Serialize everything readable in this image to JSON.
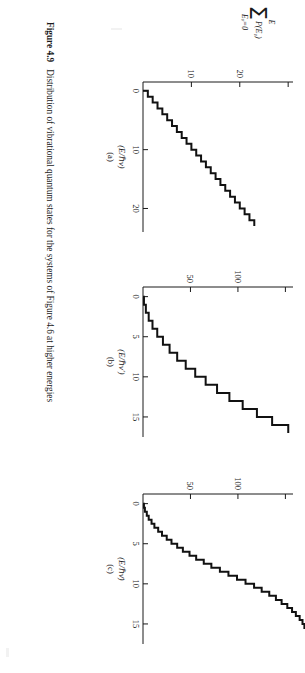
{
  "figure": {
    "number": "Figure 4.9",
    "caption": "Distribution of vibrational quantum states for the systems of Figure 4.6 at higher energies",
    "y_axis_label": {
      "upper_limit": "E",
      "symbol": "Σ",
      "argument": "P(E",
      "argument_sub": "v",
      "argument_close": ")",
      "lower_limit": "E",
      "lower_limit_sub": "v",
      "lower_limit_value": "=0"
    }
  },
  "panels": [
    {
      "letter": "(a)",
      "xlabel_open": "(E/",
      "xlabel_hbar": "ℏ",
      "xlabel_nu": "ν",
      "xlabel_close": ")",
      "xticks": [
        0,
        10,
        20
      ],
      "xlim": [
        -1.5,
        24
      ],
      "yticks": [
        10,
        20
      ],
      "ytick_unlabeled": [
        30
      ],
      "ylim": [
        0,
        31
      ]
    },
    {
      "letter": "(b)",
      "xlabel_open": "(E/",
      "xlabel_hbar": "ℏ",
      "xlabel_nu": "ν′",
      "xlabel_close": ")",
      "xticks": [
        0,
        5,
        10,
        15
      ],
      "xlim": [
        -1.2,
        17.5
      ],
      "yticks": [
        50,
        100
      ],
      "ytick_unlabeled": [
        150
      ],
      "ylim": [
        0,
        158
      ]
    },
    {
      "letter": "(c)",
      "xlabel_open": "(E/",
      "xlabel_hbar": "ℏ",
      "xlabel_nu": "ν̄",
      "xlabel_close": ")",
      "xticks": [
        0,
        5,
        10,
        15
      ],
      "xlim": [
        -1.2,
        17.5
      ],
      "yticks": [
        50,
        100
      ],
      "ytick_unlabeled": [
        150
      ],
      "ylim": [
        0,
        158
      ]
    }
  ],
  "chart_data": [
    {
      "type": "line",
      "panel": "(a)",
      "title": "",
      "xlabel": "(E/ℏν)",
      "ylabel": "Σ P(E_v), E_v=0 to E",
      "xlim": [
        -1.5,
        24
      ],
      "ylim": [
        0,
        31
      ],
      "grid": false,
      "legend": "none",
      "drawstyle": "steps-post",
      "note": "Cumulative number of vibrational quantum states vs reduced energy; rises as a simple staircase with one new state per unit of E/hv.",
      "x": [
        0,
        1,
        2,
        3,
        4,
        5,
        6,
        7,
        8,
        9,
        10,
        11,
        12,
        13,
        14,
        15,
        16,
        17,
        18,
        19,
        20,
        21,
        22
      ],
      "y": [
        1,
        2,
        3,
        4,
        5,
        6,
        7,
        8,
        9,
        10,
        11,
        12,
        13,
        14,
        15,
        16,
        17,
        18,
        19,
        20,
        21,
        22,
        23
      ]
    },
    {
      "type": "line",
      "panel": "(b)",
      "title": "",
      "xlabel": "(E/ℏν′)",
      "ylabel": "Σ P(E_v), E_v=0 to E",
      "xlim": [
        -1.2,
        17.5
      ],
      "ylim": [
        0,
        158
      ],
      "grid": false,
      "legend": "none",
      "drawstyle": "steps-post",
      "note": "Cumulative state count for a two-oscillator system; staircase with increasing tread heights, approaching ~135 at E/hv' = 16.",
      "x": [
        0,
        1,
        2,
        3,
        4,
        5,
        6,
        7,
        8,
        9,
        10,
        11,
        12,
        13,
        14,
        15,
        16
      ],
      "y": [
        1,
        3,
        6,
        10,
        15,
        21,
        28,
        36,
        45,
        55,
        66,
        78,
        91,
        105,
        120,
        136,
        153
      ]
    },
    {
      "type": "line",
      "panel": "(c)",
      "title": "",
      "xlabel": "(E/ℏν̄)",
      "ylabel": "Σ P(E_v), E_v=0 to E",
      "xlim": [
        -1.2,
        17.5
      ],
      "ylim": [
        0,
        158
      ],
      "grid": false,
      "legend": "none",
      "drawstyle": "steps-post",
      "note": "Cumulative state count for the degenerate-frequency system; finer staircase with many small steps at low energy, smoothing toward a curve.",
      "x": [
        0,
        0.5,
        1,
        1.5,
        2,
        2.5,
        3,
        3.5,
        4,
        4.5,
        5,
        5.5,
        6,
        6.5,
        7,
        7.5,
        8,
        8.5,
        9,
        9.5,
        10,
        10.5,
        11,
        11.5,
        12,
        12.5,
        13,
        13.5,
        14,
        14.5,
        15,
        15.5,
        16,
        16.5
      ],
      "y": [
        1,
        2,
        4,
        6,
        9,
        12,
        16,
        20,
        25,
        30,
        36,
        42,
        49,
        56,
        64,
        72,
        81,
        90,
        99,
        108,
        117,
        125,
        133,
        140,
        146,
        152,
        157,
        161,
        165,
        168,
        170,
        172,
        173,
        174
      ]
    }
  ]
}
